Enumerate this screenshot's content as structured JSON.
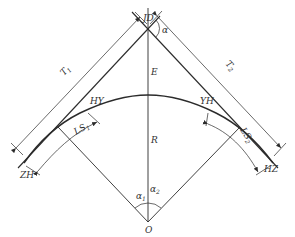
{
  "diagram": {
    "type": "transition-curve-geometry",
    "colors": {
      "stroke": "#2b2b2b",
      "text": "#333333",
      "background": "#ffffff"
    },
    "labels": {
      "jd": "JD",
      "alpha": "α",
      "e": "E",
      "r": "R",
      "hy": "HY",
      "yh": "YH",
      "zh": "ZH",
      "hz": "HZ",
      "o": "O",
      "t1_main": "T",
      "t1_sub": "1",
      "t2_main": "T",
      "t2_sub": "2",
      "ls1_main": "LS",
      "ls1_sub": "1",
      "ls2_main": "LS",
      "ls2_sub": "2",
      "alpha1_main": "α",
      "alpha1_sub": "1",
      "alpha2_main": "α",
      "alpha2_sub": "2"
    }
  }
}
